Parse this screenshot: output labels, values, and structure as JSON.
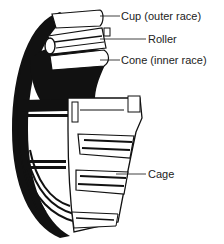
{
  "diagram": {
    "labels": [
      {
        "id": "cup",
        "text": "Cup (outer race)",
        "x": 121,
        "y": 10,
        "line_from_x": 100,
        "line_y": 16
      },
      {
        "id": "roller",
        "text": "Roller",
        "x": 148,
        "y": 33,
        "line_from_x": 100,
        "line_y": 39
      },
      {
        "id": "cone",
        "text": "Cone (inner race)",
        "x": 121,
        "y": 54,
        "line_from_x": 100,
        "line_y": 60
      },
      {
        "id": "cage",
        "text": "Cage",
        "x": 148,
        "y": 168,
        "line_from_x": 116,
        "line_y": 174
      }
    ],
    "colors": {
      "ink": "#111111",
      "paper": "#ffffff",
      "shade": "#9a9a9a"
    }
  }
}
